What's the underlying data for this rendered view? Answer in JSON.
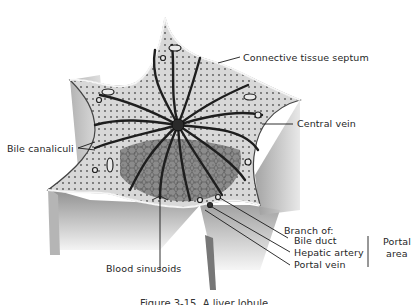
{
  "figure": {
    "subject": "Liver lobule",
    "caption": "Figure 3-15. A liver lobule"
  },
  "labels": {
    "connective_tissue_septum": "Connective tissue septum",
    "central_vein": "Central vein",
    "bile_canaliculi": "Bile canaliculi",
    "blood_sinusoids": "Blood sinusoids",
    "branch_of": "Branch of:",
    "bile_duct": "Bile duct",
    "hepatic_artery": "Hepatic artery",
    "portal_vein": "Portal vein",
    "portal_area_line1": "Portal",
    "portal_area_line2": "area"
  },
  "colors": {
    "background": "#ffffff",
    "ink": "#1a1a1a",
    "septum_fill": "#8a8a8a",
    "parenchyma_fill": "#cfcfcf",
    "cord_dark": "#222222"
  }
}
